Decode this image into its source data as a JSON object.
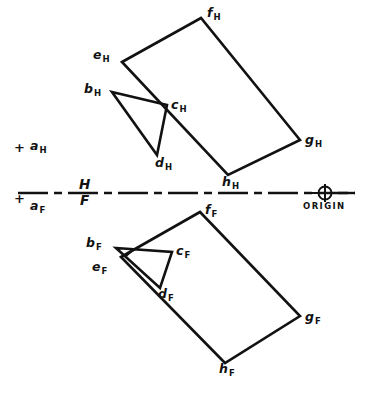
{
  "figure": {
    "stroke_color": "#121212",
    "background_color": "#ffffff",
    "width": 369,
    "height": 395
  },
  "reference_line": {
    "name": "H/F folding line",
    "label_top": "H",
    "label_bottom": "F",
    "label_x": 82,
    "label_top_y": 186,
    "label_bottom_y": 203,
    "y": 193,
    "x_start": 18,
    "x_end": 355,
    "style": "chain-dash-dot"
  },
  "origin": {
    "label": "ORIGIN",
    "label_x": 306,
    "label_y": 203,
    "cx": 325,
    "cy": 193,
    "r": 6.5
  },
  "points": {
    "horizontal_view": [
      {
        "id": "a_H",
        "letter": "a",
        "sub": "H",
        "x": 22,
        "y": 148,
        "label_x": 30,
        "label_y": 142,
        "marker": "plus",
        "on_polygon": false
      },
      {
        "id": "b_H",
        "letter": "b",
        "sub": "H",
        "x": 112,
        "y": 92,
        "label_x": 86,
        "label_y": 85,
        "marker": "none",
        "on_polygon": true
      },
      {
        "id": "c_H",
        "letter": "c",
        "sub": "H",
        "x": 167,
        "y": 105,
        "label_x": 172,
        "label_y": 101,
        "marker": "none",
        "on_polygon": true
      },
      {
        "id": "d_H",
        "letter": "d",
        "sub": "H",
        "x": 157,
        "y": 155,
        "label_x": 157,
        "label_y": 157,
        "marker": "none",
        "on_polygon": true
      },
      {
        "id": "e_H",
        "letter": "e",
        "sub": "H",
        "x": 122,
        "y": 62,
        "label_x": 95,
        "label_y": 51,
        "marker": "none",
        "on_polygon": true
      },
      {
        "id": "f_H",
        "letter": "f",
        "sub": "H",
        "x": 201,
        "y": 18,
        "label_x": 208,
        "label_y": 8,
        "marker": "none",
        "on_polygon": true
      },
      {
        "id": "g_H",
        "letter": "g",
        "sub": "H",
        "x": 300,
        "y": 140,
        "label_x": 306,
        "label_y": 137,
        "marker": "none",
        "on_polygon": true
      },
      {
        "id": "h_H",
        "letter": "h",
        "sub": "H",
        "x": 228,
        "y": 175,
        "label_x": 224,
        "label_y": 175,
        "marker": "none",
        "on_polygon": true
      }
    ],
    "frontal_view": [
      {
        "id": "a_F",
        "letter": "a",
        "sub": "F",
        "x": 22,
        "y": 199,
        "label_x": 30,
        "label_y": 200,
        "marker": "plus",
        "on_polygon": false
      },
      {
        "id": "b_F",
        "letter": "b",
        "sub": "F",
        "x": 116,
        "y": 248,
        "label_x": 88,
        "label_y": 239,
        "marker": "none",
        "on_polygon": true
      },
      {
        "id": "c_F",
        "letter": "c",
        "sub": "F",
        "x": 172,
        "y": 252,
        "label_x": 177,
        "label_y": 246,
        "marker": "none",
        "on_polygon": true
      },
      {
        "id": "d_F",
        "letter": "d",
        "sub": "F",
        "x": 160,
        "y": 288,
        "label_x": 159,
        "label_y": 288,
        "marker": "none",
        "on_polygon": true
      },
      {
        "id": "e_F",
        "letter": "e",
        "sub": "F",
        "x": 121,
        "y": 257,
        "label_x": 94,
        "label_y": 262,
        "marker": "none",
        "on_polygon": true
      },
      {
        "id": "f_F",
        "letter": "f",
        "sub": "F",
        "x": 200,
        "y": 212,
        "label_x": 206,
        "label_y": 206,
        "marker": "none",
        "on_polygon": true
      },
      {
        "id": "g_F",
        "letter": "g",
        "sub": "F",
        "x": 300,
        "y": 316,
        "label_x": 306,
        "label_y": 315,
        "marker": "none",
        "on_polygon": true
      },
      {
        "id": "h_F",
        "letter": "h",
        "sub": "F",
        "x": 225,
        "y": 363,
        "label_x": 221,
        "label_y": 362,
        "marker": "none",
        "on_polygon": true
      }
    ]
  },
  "shapes": {
    "horizontal_view": {
      "plane_efgh": {
        "name": "plane-efgh-top-view",
        "vertices": "122,62 201,18 300,140 228,175",
        "closed": true
      },
      "triangle_bcd": {
        "name": "triangle-bcd-top-view",
        "vertices": "112,92 167,105 157,155",
        "closed": true
      }
    },
    "frontal_view": {
      "plane_efgh": {
        "name": "plane-efgh-front-view",
        "vertices": "121,257 200,212 300,316 225,363",
        "closed": true
      },
      "triangle_bcd": {
        "name": "triangle-bcd-front-view",
        "vertices": "116,248 172,252 160,288",
        "closed": true
      },
      "hidden_tick": {
        "name": "hidden-edge-tick",
        "x1": 126,
        "y1": 256,
        "x2": 133,
        "y2": 250
      }
    }
  }
}
